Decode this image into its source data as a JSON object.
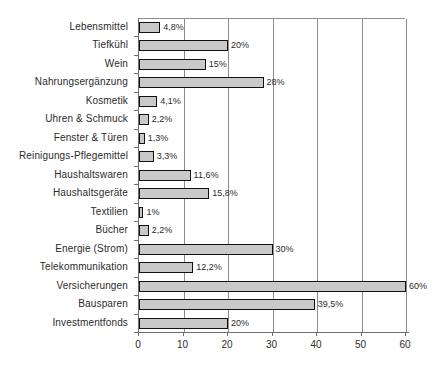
{
  "chart_data": {
    "type": "bar",
    "orientation": "horizontal",
    "title": "",
    "subtitle": "",
    "xlabel": "",
    "ylabel": "",
    "xlim": [
      0,
      60
    ],
    "xticks": [
      "0",
      "10",
      "20",
      "30",
      "40",
      "50",
      "60"
    ],
    "xtick_values": [
      0,
      10,
      20,
      30,
      40,
      50,
      60
    ],
    "grid": "vertical",
    "legend": "none",
    "bar_fill_color": "#c9c9c9",
    "bar_border_color": "#111111",
    "categories": [
      "Lebensmittel",
      "Tiefkühl",
      "Wein",
      "Nahrungsergänzung",
      "Kosmetik",
      "Uhren & Schmuck",
      "Fenster & Türen",
      "Reinigungs-Pflegemittel",
      "Haushaltswaren",
      "Haushaltsgeräte",
      "Textilien",
      "Bücher",
      "Energie (Strom)",
      "Telekommunikation",
      "Versicherungen",
      "Bausparen",
      "Investmentfonds"
    ],
    "values": [
      4.8,
      20,
      15,
      28,
      4.1,
      2.2,
      1.3,
      3.3,
      11.6,
      15.8,
      1,
      2.2,
      30,
      12.2,
      60,
      39.5,
      20
    ],
    "data_labels": [
      "4,8%",
      "20%",
      "15%",
      "28%",
      "4,1%",
      "2,2%",
      "1,3%",
      "3,3%",
      "11,6%",
      "15,8%",
      "1%",
      "2,2%",
      "30%",
      "12,2%",
      "60%",
      "39,5%",
      "20%"
    ]
  }
}
